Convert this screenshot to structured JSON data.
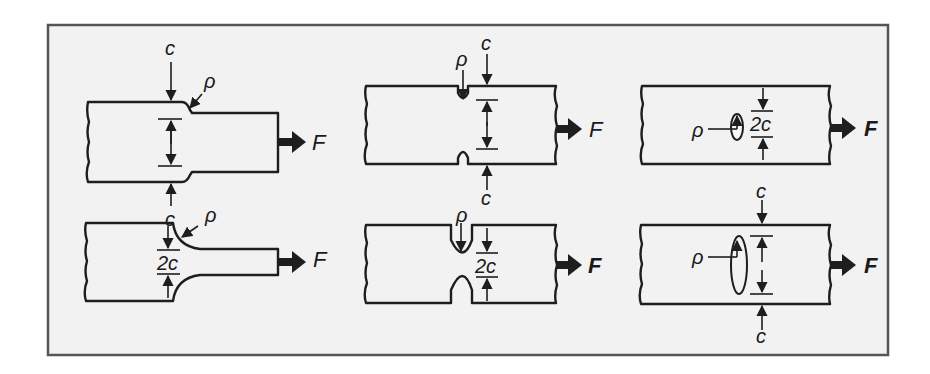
{
  "figure": {
    "frame": {
      "background": "#f2f2f2",
      "border": "#555555"
    },
    "colors": {
      "outline": "#1e1e1e",
      "gradient_dark": "#1a1a1a",
      "gradient_light": "#ffffff"
    },
    "panels": [
      {
        "id": "shoulder-fillet-small",
        "labels": {
          "top": "c",
          "bottom": "c",
          "radius": "ρ",
          "force": "F"
        }
      },
      {
        "id": "double-notch-small",
        "labels": {
          "top": "c",
          "bottom": "c",
          "radius": "ρ",
          "force": "F"
        }
      },
      {
        "id": "internal-hole-small",
        "labels": {
          "width": "2c",
          "radius": "ρ",
          "force": "F"
        }
      },
      {
        "id": "shoulder-fillet-large",
        "labels": {
          "width": "2c",
          "radius": "ρ",
          "force": "F"
        }
      },
      {
        "id": "double-notch-large",
        "labels": {
          "width": "2c",
          "radius": "ρ",
          "force": "F"
        }
      },
      {
        "id": "internal-ellipse-large",
        "labels": {
          "top": "c",
          "bottom": "c",
          "radius": "ρ",
          "force": "F"
        }
      }
    ]
  }
}
